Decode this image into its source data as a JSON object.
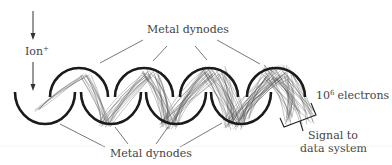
{
  "diagram": {
    "labels": {
      "ion": "Ion",
      "ion_charge": "+",
      "dynodes_top": "Metal dynodes",
      "dynodes_bottom": "Metal dynodes",
      "electrons_base": "10",
      "electrons_exp": "6",
      "electrons_text": "electrons",
      "signal_line1": "Signal to",
      "signal_line2": "data system"
    },
    "dynodes": {
      "top": [
        {
          "cx": 79,
          "cy": 98,
          "r": 29
        },
        {
          "cx": 144,
          "cy": 98,
          "r": 29
        },
        {
          "cx": 209,
          "cy": 98,
          "r": 29
        },
        {
          "cx": 276,
          "cy": 98,
          "r": 29
        }
      ],
      "bottom": [
        {
          "cx": 45,
          "cy": 98,
          "r": 30
        },
        {
          "cx": 111,
          "cy": 98,
          "r": 30
        },
        {
          "cx": 176,
          "cy": 98,
          "r": 30
        },
        {
          "cx": 241,
          "cy": 98,
          "r": 30
        }
      ]
    },
    "colors": {
      "dynode": "#1a1a1a",
      "electron_paths": "#555555",
      "text": "#444444"
    }
  }
}
